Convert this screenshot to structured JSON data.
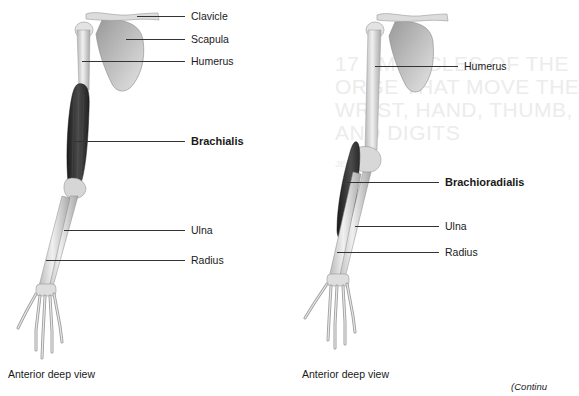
{
  "background_bleed": {
    "heading_lines": [
      "17 | MUSCLES OF THE",
      "ORGE THAT MOVE THE",
      "WRIST, HAND, THUMB,",
      "AND DIGITS"
    ],
    "section_label": "JECTIVE"
  },
  "figures": [
    {
      "id": "left",
      "view_caption": "Anterior deep view",
      "labels": [
        {
          "text": "Clavicle",
          "bold": false
        },
        {
          "text": "Scapula",
          "bold": false
        },
        {
          "text": "Humerus",
          "bold": false
        },
        {
          "text": "Brachialis",
          "bold": true
        },
        {
          "text": "Ulna",
          "bold": false
        },
        {
          "text": "Radius",
          "bold": false
        }
      ]
    },
    {
      "id": "right",
      "view_caption": "Anterior deep view",
      "labels": [
        {
          "text": "Humerus",
          "bold": false
        },
        {
          "text": "Brachioradialis",
          "bold": true
        },
        {
          "text": "Ulna",
          "bold": false
        },
        {
          "text": "Radius",
          "bold": false
        }
      ]
    }
  ],
  "footer": {
    "continued": "(Continu"
  },
  "colors": {
    "bone": "#d9d9d9",
    "bone_shade": "#a9a9a9",
    "muscle": "#2e2e2e",
    "leader_line": "#333333"
  }
}
